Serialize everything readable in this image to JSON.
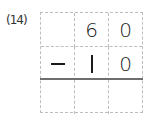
{
  "problem": {
    "label": "(14)",
    "operation": "subtraction",
    "rows": [
      {
        "cells": [
          "",
          "6",
          "0"
        ]
      },
      {
        "cells": [
          "−",
          "1",
          "0"
        ]
      },
      {
        "cells": [
          "",
          "",
          ""
        ]
      }
    ],
    "minuend": "60",
    "subtrahend": "10",
    "answer": ""
  },
  "colors": {
    "grid_line": "#bdbdbd",
    "sum_line": "#6e6e6e",
    "digit": "#1a1a1a"
  }
}
